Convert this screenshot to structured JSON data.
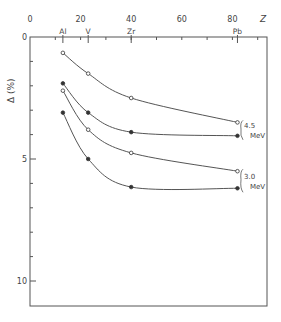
{
  "chart_data": {
    "type": "line",
    "title": "",
    "xlabel": "Z",
    "ylabel": "Δ (%)",
    "xlim": [
      0,
      90
    ],
    "ylim": [
      0,
      11
    ],
    "y_inverted": true,
    "x_ticks": [
      "0",
      "20",
      "40",
      "60",
      "80"
    ],
    "y_ticks": [
      "0",
      "5",
      "10"
    ],
    "element_labels": [
      {
        "label": "Al",
        "z": 13
      },
      {
        "label": "V",
        "z": 23
      },
      {
        "label": "Zr",
        "z": 40
      },
      {
        "label": "Pb",
        "z": 82
      }
    ],
    "x": [
      13,
      23,
      40,
      82
    ],
    "series": [
      {
        "name": "4.5 MeV (open)",
        "marker": "open-circle",
        "values": [
          0.65,
          1.5,
          2.5,
          3.5
        ]
      },
      {
        "name": "4.5 MeV (filled)",
        "marker": "filled-circle",
        "values": [
          1.9,
          3.1,
          3.9,
          4.05
        ]
      },
      {
        "name": "3.0 MeV (open)",
        "marker": "open-circle",
        "values": [
          2.2,
          3.8,
          4.75,
          5.5
        ]
      },
      {
        "name": "3.0 MeV (filled)",
        "marker": "filled-circle",
        "values": [
          3.1,
          5.0,
          6.15,
          6.2
        ]
      }
    ],
    "annotations": [
      {
        "text": "4.5",
        "sub": "MeV",
        "group": "upper"
      },
      {
        "text": "3.0",
        "sub": "MeV",
        "group": "lower"
      }
    ],
    "grid": false,
    "legend": "none"
  }
}
